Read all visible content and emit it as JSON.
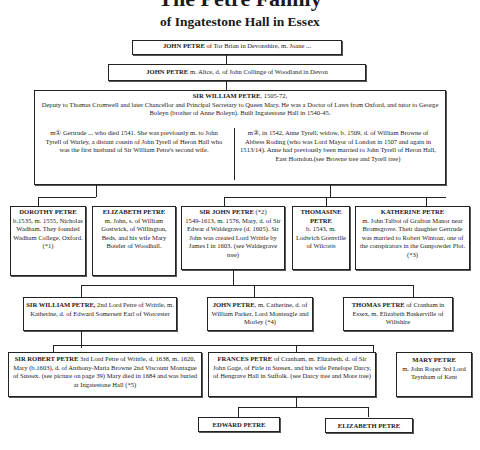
{
  "title": "The Petre Family",
  "subtitle": "of Ingatestone Hall in Essex",
  "people": {
    "john_tor_brian": {
      "name": "JOHN PETRE",
      "text": " of Tor Brian in Devonshire, m. Joane ..."
    },
    "john_alice": {
      "name": "JOHN PETRE",
      "text": " m. Alice, d. of John Collinge of Woodland in Devon"
    },
    "sir_william": {
      "name": "SIR WILLIAM PETRE",
      "dates": ", 1505-72,",
      "text": "Deputy to Thomas Cromwell and later Chancellor and Principal Secretary to Queen Mary. He was a Doctor of Laws from Oxford, and tutor to George Boleyn (brother of Anne Boleyn). Built Ingatestone Hall in 1540-45.",
      "marriage1": "m① Gertrude ... who died 1541. She was previously m. to John Tyrell of Warley, a distant cousin of John Tyrell of Heron Hall who was the first husband of Sir William Petre's second wife.",
      "marriage2": "m②, in 1542, Anne Tyrell, widow, b. 1509, d. of William Browne of Abbess Roding (who was Lord Mayor of London in 1507 and again in 1513/14). Anne had previously been married to John Tyrell of Heron Hall, East Horndon.(see Browne tree and Tyrell tree)"
    },
    "dorothy": {
      "name": "DOROTHY PETRE",
      "text": "b.1535, m. 1555, Nicholas Wadham. They founded Wadham College, Oxford. (*1)"
    },
    "elizabeth1": {
      "name": "ELIZABETH PETRE",
      "text": "m. John, s. of William Gostwick, of Willington, Beds, and his wife Mary Boteler of Woodhall."
    },
    "sir_john": {
      "name": "SIR JOHN PETRE",
      "note": " (*2)",
      "text": "1549-1613, m. 1576, Mary, d. of Sir Edwar d Waldegrave (d. 1605). Sir John was created Lord Writtle by James I in 1603. (see Waldegrave tree)"
    },
    "thomasine": {
      "name": "THOMASINE PETRE",
      "text": "b. 1543, m. Lodwich Grenville of Wilcotts"
    },
    "katherine": {
      "name": "KATHERINE PETRE",
      "text": "m. John Talbot of Grafton Manor near Bromsgrove. Their daughter Gertrude was married to Robert Wintour, one of the conspirators in the Gunpowder Plot. (*3)"
    },
    "sir_william2": {
      "name": "SIR WILLIAM PETRE,",
      "text": " 2nd Lord Petre of Writtle, m. Katherine, d. of Edward Somersett Earl of Worcester"
    },
    "john_catherine": {
      "name": "JOHN PETRE",
      "text": ", m. Catherine, d. of William Parker, Lord Monteagle and Morley (*4)"
    },
    "thomas": {
      "name": "THOMAS PETRE",
      "text": " of Cranham in Essex, m. Elizabeth Baskerville of Wiltshire"
    },
    "sir_robert": {
      "name": "SIR ROBERT PETRE",
      "text": " 3rd Lord Petre of Writtle, d. 1638, m. 1620, Mary (b.1603), d. of Anthony-Maria Browne 2nd Viscount Montague of Sussex. (see picture on page 39) Mary died in 1684 and was buried at Ingatestone Hall (*5)"
    },
    "frances": {
      "name": "FRANCES PETRE",
      "text": " of Cranham, m. Elizabeth, d. of Sir John Gage, of Firle in Sussex, and his wife Penelope Darcy, of Hengrave Hall in Suffolk. (see Darcy tree and More tree)"
    },
    "mary": {
      "name": "MARY PETRE",
      "text": "m. John Roper 3rd Lord Teynham of Kent"
    },
    "edward": {
      "name": "EDWARD PETRE"
    },
    "elizabeth2": {
      "name": "ELIZABETH PETRE"
    }
  }
}
